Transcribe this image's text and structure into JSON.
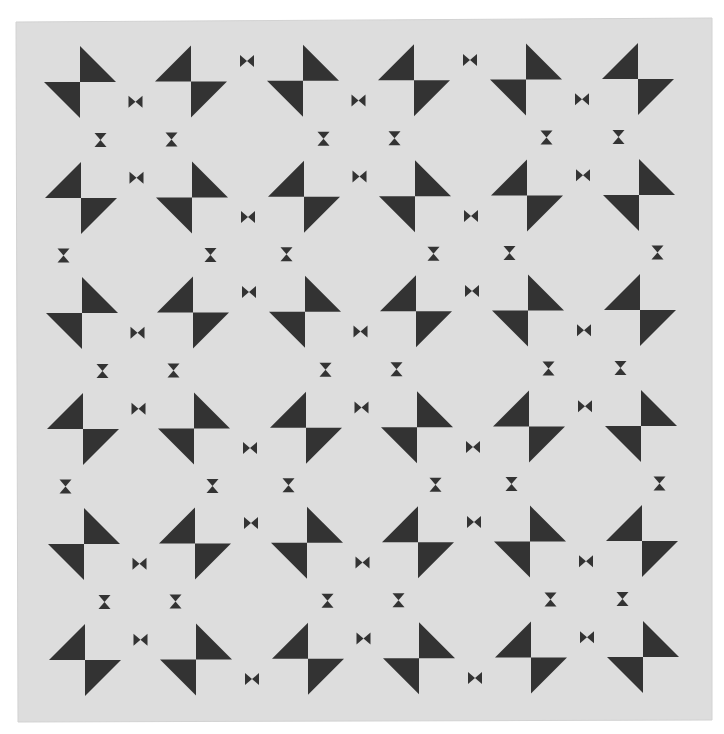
{
  "image": {
    "description": "Photograph of a quilt with a repeating pattern of charcoal pinwheel triangle blocks and small bowtie / hourglass motifs on light gray fabric",
    "width": 724,
    "height": 734
  },
  "colors": {
    "page_background": "#ffffff",
    "fabric": "#dddddd",
    "fabric_edge": "#d2d2d2",
    "motif": "#333333"
  },
  "quilt": {
    "corners": [
      [
        16,
        22
      ],
      [
        712,
        18
      ],
      [
        712,
        720
      ],
      [
        18,
        722
      ]
    ],
    "grid": {
      "columns": 6,
      "rows": 6,
      "col_centers": [
        80,
        191,
        303,
        414,
        526,
        638
      ],
      "row_centers": [
        82,
        198,
        313,
        429,
        544,
        660
      ],
      "x_shift_per_row": 1,
      "y_shift_per_col": -0.6
    },
    "pinwheel": {
      "leg": 36,
      "row_patterns": [
        [
          "A",
          "B",
          "A",
          "B",
          "A",
          "B"
        ],
        [
          "B",
          "A",
          "B",
          "A",
          "B",
          "A"
        ],
        [
          "A",
          "B",
          "A",
          "B",
          "A",
          "B"
        ],
        [
          "B",
          "A",
          "B",
          "A",
          "B",
          "A"
        ],
        [
          "A",
          "B",
          "A",
          "B",
          "A",
          "B"
        ],
        [
          "B",
          "A",
          "B",
          "A",
          "B",
          "A"
        ]
      ],
      "types": {
        "A": "top triangle up-right of center, bottom triangle down-left of center",
        "B": "top triangle up-left of center, bottom triangle down-right of center"
      }
    },
    "bowtie": {
      "width": 14,
      "height": 12,
      "offset_y": 20
    },
    "hourglass": {
      "width": 12,
      "height": 14,
      "inner_offset_x": 20,
      "outer_offset_x": 18
    }
  }
}
